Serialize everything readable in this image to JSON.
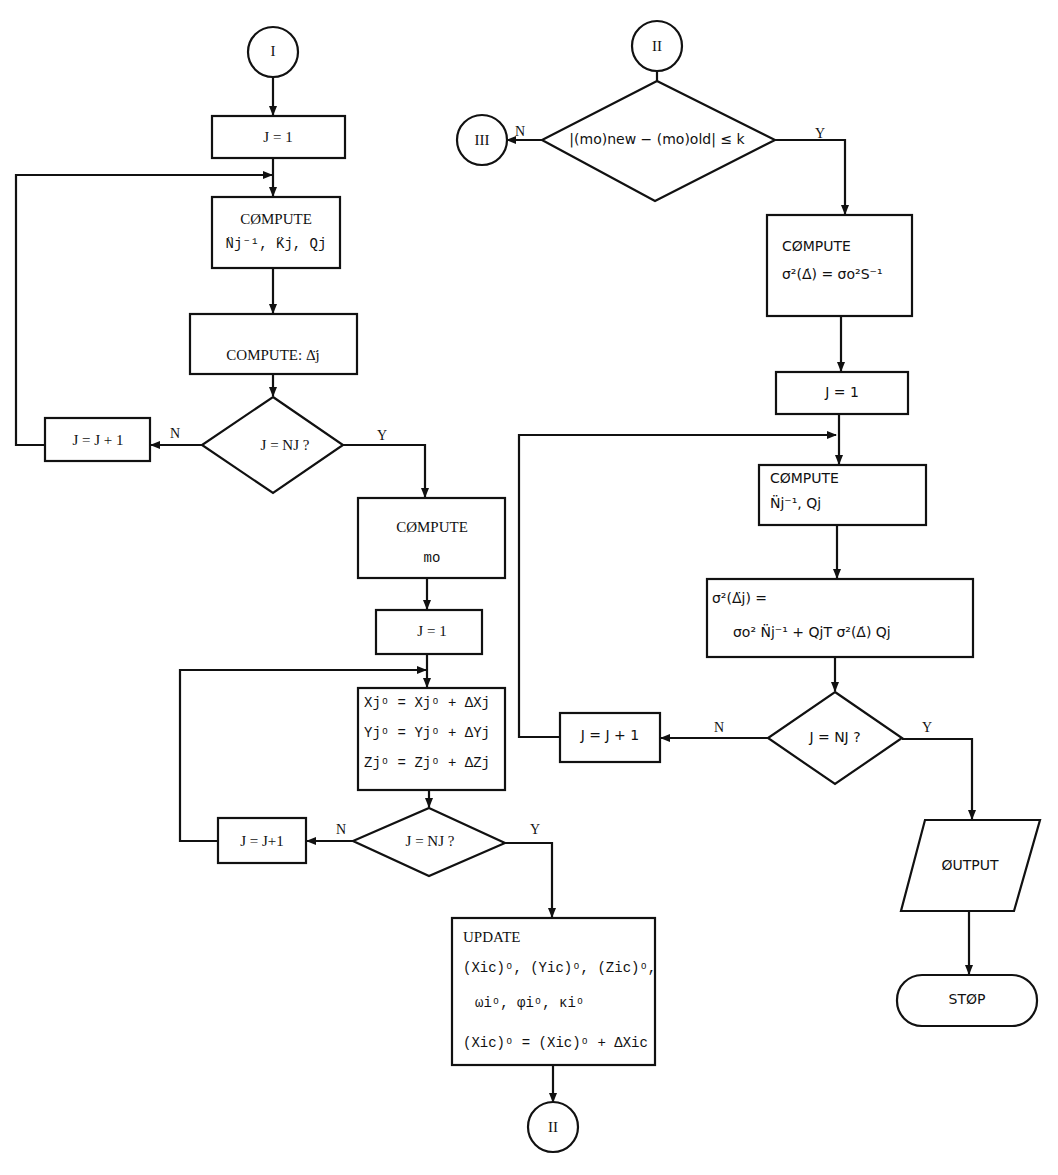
{
  "diagram": {
    "type": "flowchart",
    "left_column": {
      "connector_start": "I",
      "init_j": "J = 1",
      "compute_nkq": {
        "title": "CØMPUTE",
        "formula": "N̈j⁻¹, K̈j, Qj"
      },
      "compute_delta": "COMPUTE:  Δ̈j",
      "decision_1": "J = NJ ?",
      "increment_1": "J = J + 1",
      "compute_mo": {
        "title": "CØMPUTE",
        "formula": "mo"
      },
      "init_j_2": "J = 1",
      "update_coords": [
        "Xjᵒ = Xjᵒ + ΔXj",
        "Yjᵒ = Yjᵒ + ΔYj",
        "Zjᵒ = Zjᵒ + ΔZj"
      ],
      "decision_2": "J = NJ ?",
      "increment_2": "J = J+1",
      "update_box": {
        "title": "UPDATE",
        "lines": [
          "(Xic)ᵒ, (Yic)ᵒ, (Zic)ᵒ,",
          "ωiᵒ,   φiᵒ,   κiᵒ",
          "(Xic)ᵒ = (Xic)ᵒ + ΔXic"
        ]
      },
      "connector_end": "II"
    },
    "right_column": {
      "connector_start": "II",
      "decision_convergence": "|(mo)new − (mo)old| ≤ k",
      "connector_exit": "III",
      "compute_sigma": {
        "title": "CØMPUTE",
        "formula": "σ²(Δ̇) = σo²S⁻¹"
      },
      "init_j": "J = 1",
      "compute_nq": {
        "title": "CØMPUTE",
        "formula": "N̈j⁻¹,  Qj"
      },
      "sigma_delta_j": {
        "line1": "σ²(Δ̈j) =",
        "line2": "σo² N̈j⁻¹ + QjT σ²(Δ̇) Qj"
      },
      "decision": "J = NJ ?",
      "increment": "J = J + 1",
      "output": "ØUTPUT",
      "stop": "STØP"
    },
    "branch_labels": {
      "yes": "Y",
      "no": "N"
    }
  }
}
